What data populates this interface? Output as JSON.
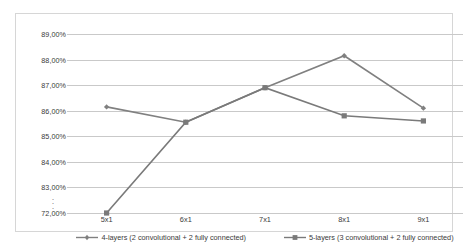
{
  "chart_data": {
    "type": "line",
    "title": "",
    "xlabel": "",
    "ylabel": "",
    "categories": [
      "5x1",
      "6x1",
      "7x1",
      "8x1",
      "9x1"
    ],
    "ylim": [
      72.0,
      89.0
    ],
    "y_ticks": [
      "89,00%",
      "88,00%",
      "87,00%",
      "86,00%",
      "85,00%",
      "84,00%",
      "83,00%",
      "72,00%"
    ],
    "y_tick_values": [
      89.0,
      88.0,
      87.0,
      86.0,
      85.0,
      84.0,
      83.0,
      72.0
    ],
    "y_axis_break": ":",
    "y_axis_break_note": "axis break between 83,00% and 72,00%",
    "grid": true,
    "legend_position": "bottom",
    "series": [
      {
        "name": "4-layers (2 convolutional + 2 fully connected)",
        "short_name": "4-layers",
        "marker": "diamond",
        "color": "#808080",
        "values": [
          86.15,
          85.55,
          86.9,
          88.15,
          86.1
        ],
        "value_labels": [
          "86,15%",
          "85,55%",
          "86,90%",
          "88,15%",
          "86,10%"
        ]
      },
      {
        "name": "5-layers (3 convolutional + 2 fully connected)",
        "short_name": "5-layers",
        "marker": "square",
        "color": "#7a7a7a",
        "values": [
          72.0,
          85.55,
          86.9,
          85.8,
          85.6
        ],
        "value_labels": [
          "72,00%",
          "85,55%",
          "86,90%",
          "85,80%",
          "85,60%"
        ]
      }
    ]
  },
  "legend": {
    "items": [
      {
        "label": "4-layers (2 convolutional + 2 fully connected)"
      },
      {
        "label": "5-layers (3 convolutional + 2 fully connected)"
      }
    ]
  },
  "colors": {
    "series_1": "#808080",
    "series_2": "#7a7a7a",
    "gridline": "#c9c9c9",
    "frame": "#d6d6d6",
    "text": "#3a3a3a"
  }
}
